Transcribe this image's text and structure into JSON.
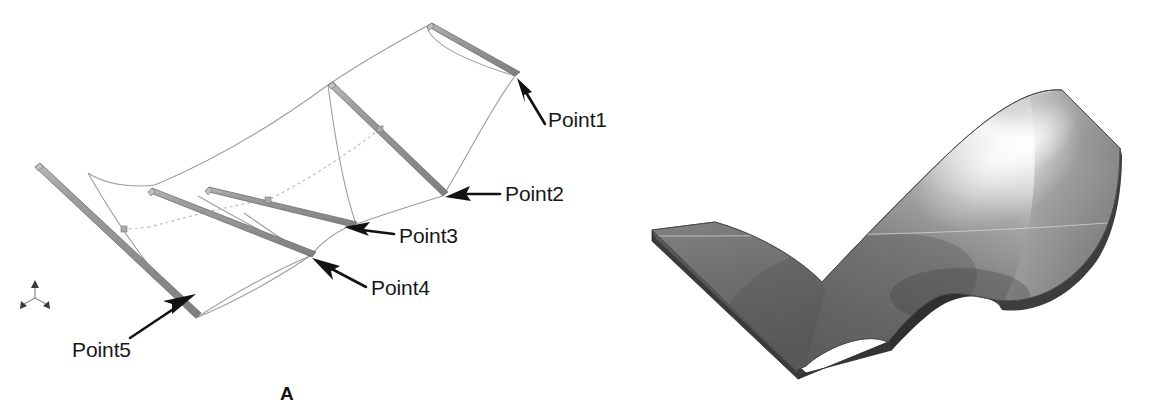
{
  "figure": {
    "width": 1162,
    "height": 419,
    "background": "#ffffff"
  },
  "panels": [
    {
      "id": "A",
      "caption": "A",
      "description": "Wireframe CAD view showing five edge-on cross-section planes connected by guide curves, with callout arrows labelling Point1 through Point5",
      "axis_triad_name": "coordinate-triad-icon"
    },
    {
      "id": "B",
      "caption": "B",
      "description": "Shaded rendering of the lofted solid surface generated from the cross sections in panel A"
    }
  ],
  "callouts": [
    {
      "id": "point1",
      "label": "Point1"
    },
    {
      "id": "point2",
      "label": "Point2"
    },
    {
      "id": "point3",
      "label": "Point3"
    },
    {
      "id": "point4",
      "label": "Point4"
    },
    {
      "id": "point5",
      "label": "Point5"
    }
  ],
  "colors": {
    "background": "#ffffff",
    "section_plane_face": "#8a8a8a",
    "section_plane_edge": "#6d6d6d",
    "section_plane_top": "#b4b4b4",
    "wire_line": "#9a9a9a",
    "dashed_guide": "#b6b6b6",
    "arrow": "#121212",
    "text": "#181818",
    "surface_dark": "#5d5d5d",
    "surface_mid": "#8e8e8e",
    "surface_light": "#efefef",
    "surface_edge": "#2e2e2e",
    "surface_underside": "#6a6a6a"
  }
}
